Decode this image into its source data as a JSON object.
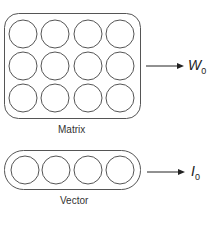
{
  "diagram": {
    "matrix": {
      "label": "Matrix",
      "rows": 3,
      "cols": 4,
      "output_symbol": "W",
      "output_subscript": "0"
    },
    "vector": {
      "label": "Vector",
      "cols": 4,
      "output_symbol": "I",
      "output_subscript": "0"
    },
    "colors": {
      "stroke": "#555555",
      "background": "#ffffff"
    }
  }
}
